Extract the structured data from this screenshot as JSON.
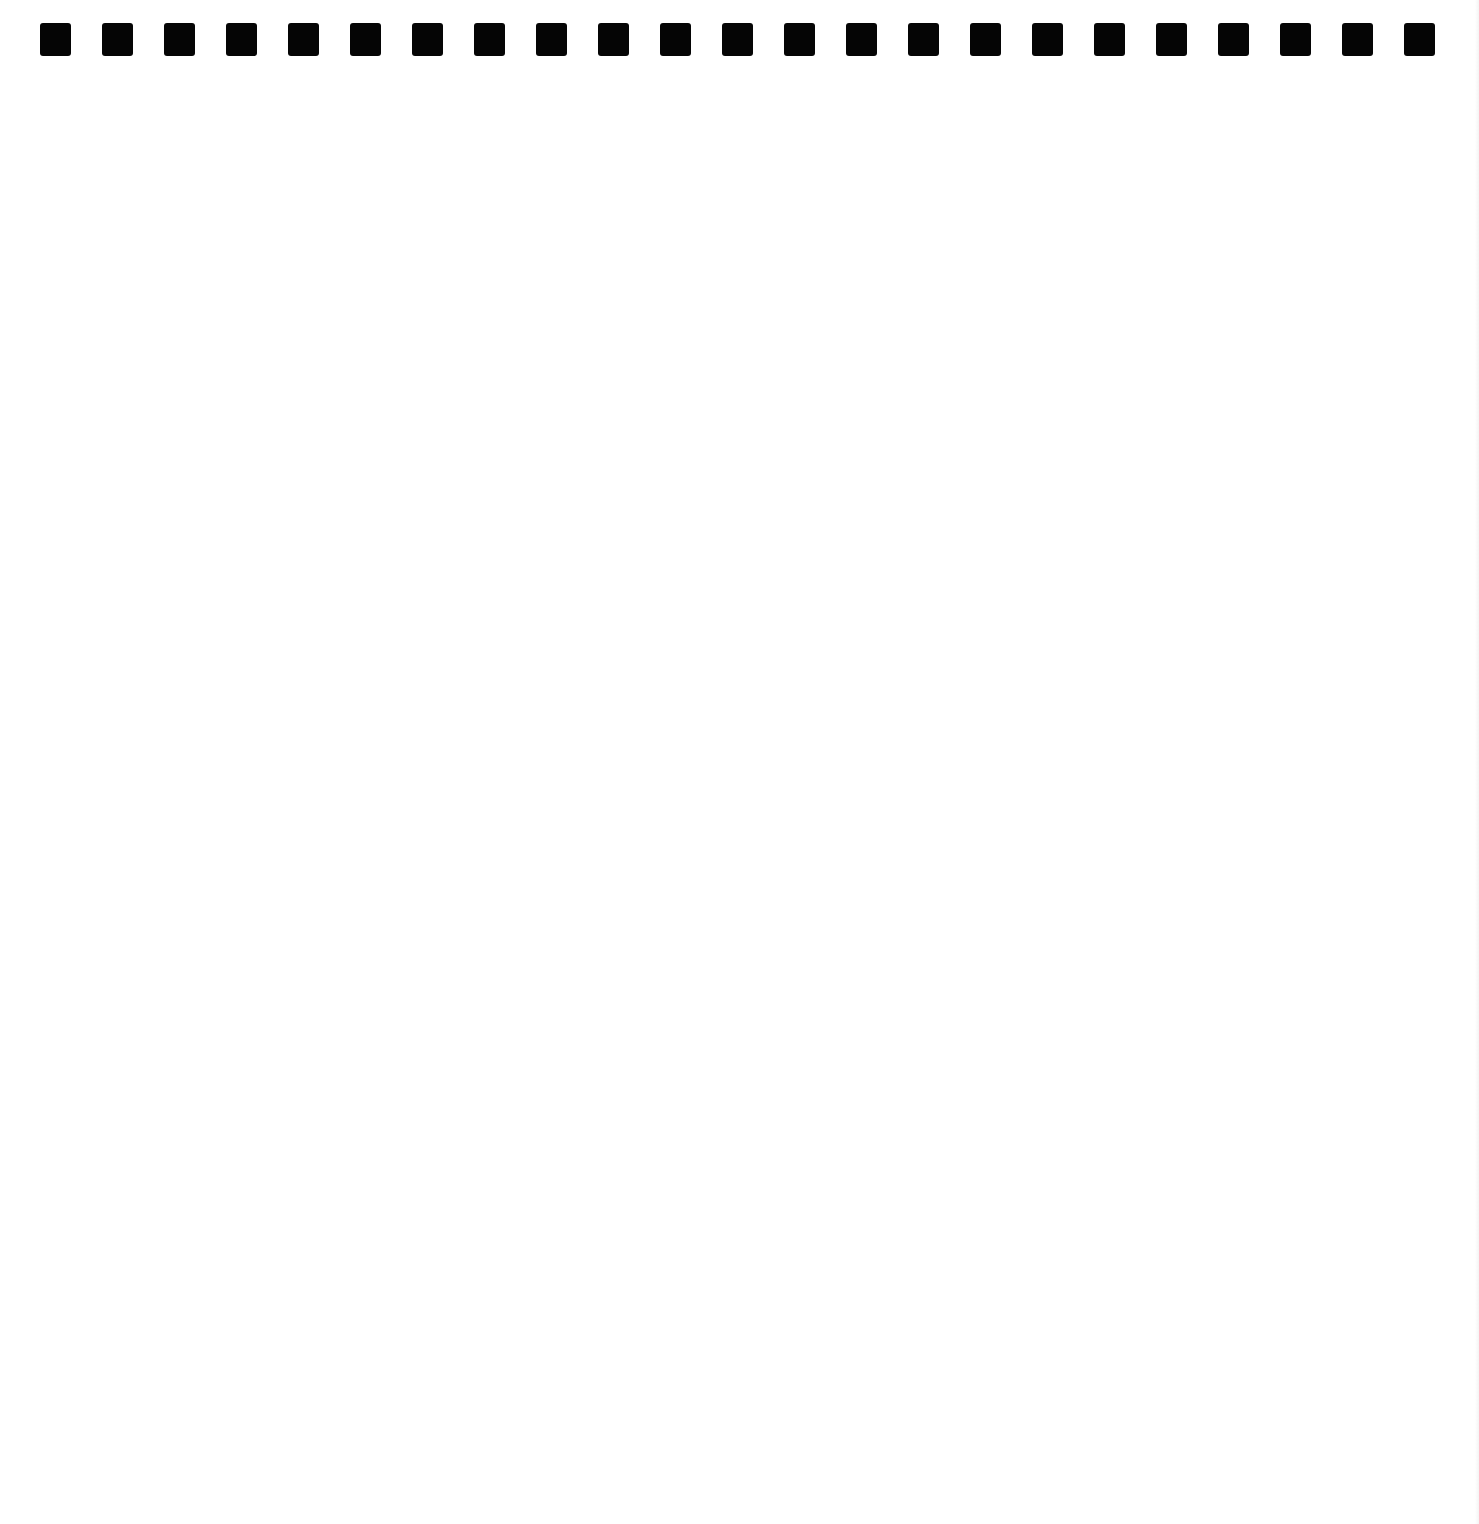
{
  "page": {
    "type": "blank-notebook-sheet",
    "background_color": "#ffffff",
    "binding": {
      "hole_count": 23,
      "hole_color": "#050505",
      "hole_shape": "square",
      "first_hole_left": 40,
      "hole_pitch": 62.0,
      "hole_top": 23,
      "hole_width": 31,
      "hole_height": 33
    }
  }
}
